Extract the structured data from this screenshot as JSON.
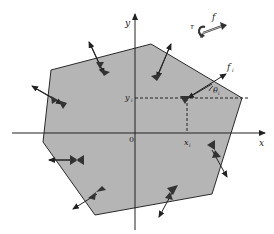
{
  "diagram": {
    "title": "",
    "colors": {
      "background": "#ffffff",
      "polygon_fill": "#b5b5b5",
      "polygon_stroke": "#2a2a2a",
      "axis": "#222222",
      "contact": "#333333"
    },
    "axes": {
      "x_label": "x",
      "y_label": "y",
      "origin_label": "0"
    },
    "point": {
      "x_label": "x",
      "x_sub": "i",
      "y_label": "y",
      "y_sub": "i"
    },
    "force": {
      "label": "f",
      "sub": "i",
      "angle_label": "θ",
      "angle_sub": "i"
    },
    "wrench": {
      "torque_label": "τ",
      "force_label": "f"
    },
    "polygon_vertices": [
      [
        51,
        70
      ],
      [
        151,
        44
      ],
      [
        242,
        98
      ],
      [
        212,
        194
      ],
      [
        95,
        215
      ],
      [
        43,
        142
      ]
    ],
    "contact_count": 9
  }
}
